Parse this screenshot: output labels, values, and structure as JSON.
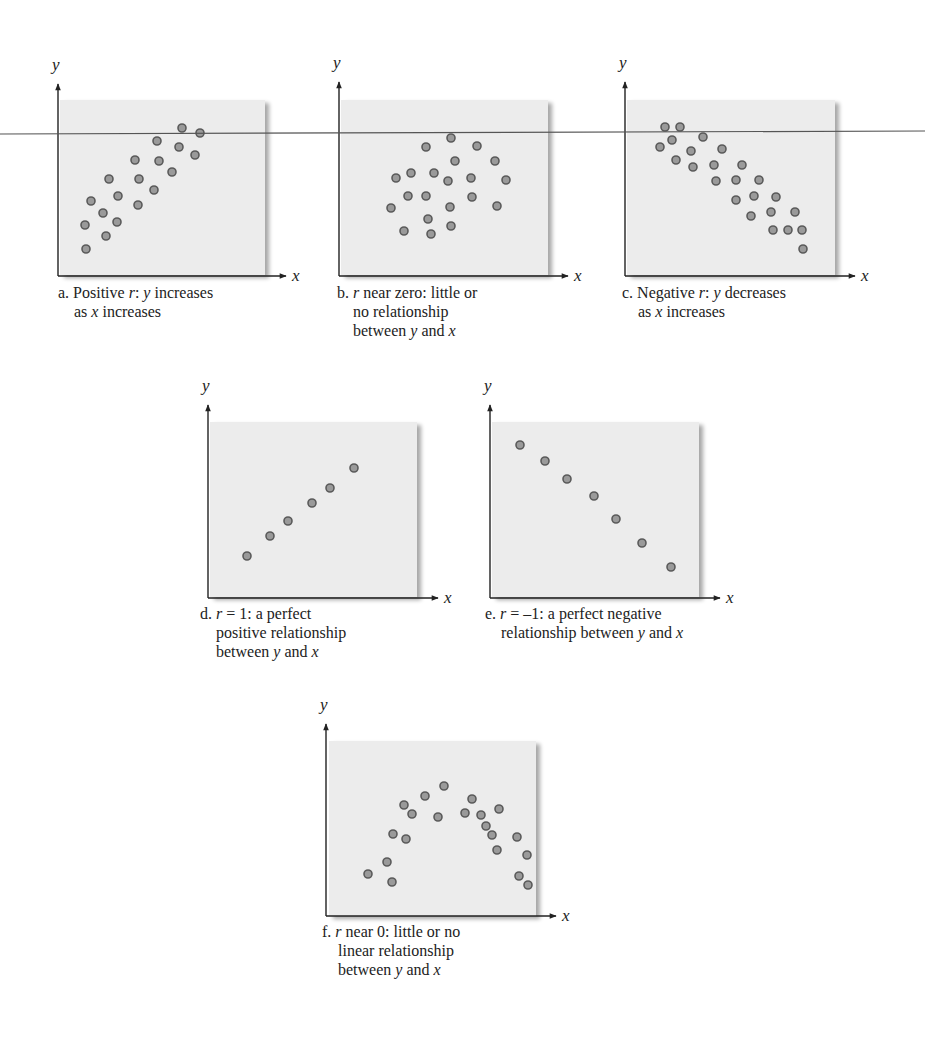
{
  "figure": {
    "stray_line": {
      "x1": 0,
      "y1": 134,
      "x2": 925,
      "y2": 131,
      "color": "#555555"
    },
    "colors": {
      "panel_fill": "#ececec",
      "panel_shadow": "#c8c8c8",
      "dot_fill": "#9a9a9a",
      "dot_stroke": "#5a5a5a",
      "axis": "#222222"
    }
  },
  "chart_data": [
    {
      "type": "scatter",
      "id": "a",
      "title": "a. Positive r: y increases as x increases",
      "caption_lines": [
        "a. Positive <i>r</i>: <i>y</i> increases",
        "as <i>x</i> increases"
      ],
      "xlabel": "x",
      "ylabel": "y",
      "axis": {
        "ox": 58,
        "oy": 276,
        "ytop": 84,
        "xend": 286
      },
      "rect": {
        "x": 60,
        "y": 100,
        "w": 205,
        "h": 175
      },
      "caption": {
        "x": 58,
        "y": 283
      },
      "points": [
        [
          182,
          128
        ],
        [
          200,
          133
        ],
        [
          157,
          141
        ],
        [
          179,
          147
        ],
        [
          195,
          155
        ],
        [
          135,
          160
        ],
        [
          159,
          161
        ],
        [
          172,
          172
        ],
        [
          109,
          179
        ],
        [
          139,
          179
        ],
        [
          154,
          190
        ],
        [
          91,
          201
        ],
        [
          118,
          196
        ],
        [
          103,
          213
        ],
        [
          138,
          205
        ],
        [
          117,
          222
        ],
        [
          85,
          225
        ],
        [
          106,
          236
        ],
        [
          86,
          249
        ]
      ]
    },
    {
      "type": "scatter",
      "id": "b",
      "title": "b. r near zero: little or no relationship between y and x",
      "caption_lines": [
        "b. <i>r</i> near zero: little or",
        "no relationship",
        "between <i>y</i> and <i>x</i>"
      ],
      "xlabel": "x",
      "ylabel": "y",
      "axis": {
        "ox": 339,
        "oy": 276,
        "ytop": 82,
        "xend": 568
      },
      "rect": {
        "x": 341,
        "y": 100,
        "w": 207,
        "h": 175
      },
      "caption": {
        "x": 337,
        "y": 283
      },
      "points": [
        [
          451,
          138
        ],
        [
          426,
          147
        ],
        [
          477,
          146
        ],
        [
          455,
          161
        ],
        [
          495,
          161
        ],
        [
          396,
          178
        ],
        [
          411,
          173
        ],
        [
          434,
          173
        ],
        [
          448,
          181
        ],
        [
          471,
          178
        ],
        [
          506,
          180
        ],
        [
          408,
          196
        ],
        [
          426,
          196
        ],
        [
          472,
          197
        ],
        [
          391,
          208
        ],
        [
          450,
          207
        ],
        [
          497,
          206
        ],
        [
          428,
          219
        ],
        [
          404,
          231
        ],
        [
          451,
          226
        ],
        [
          431,
          234
        ]
      ]
    },
    {
      "type": "scatter",
      "id": "c",
      "title": "c. Negative r: y decreases as x increases",
      "caption_lines": [
        "c. Negative <i>r</i>: <i>y</i> decreases",
        "as <i>x</i> increases"
      ],
      "xlabel": "x",
      "ylabel": "y",
      "axis": {
        "ox": 625,
        "oy": 276,
        "ytop": 82,
        "xend": 855
      },
      "rect": {
        "x": 627,
        "y": 100,
        "w": 208,
        "h": 175
      },
      "caption": {
        "x": 622,
        "y": 283
      },
      "points": [
        [
          665,
          127
        ],
        [
          680,
          127
        ],
        [
          672,
          140
        ],
        [
          703,
          137
        ],
        [
          660,
          147
        ],
        [
          691,
          151
        ],
        [
          722,
          149
        ],
        [
          676,
          160
        ],
        [
          693,
          167
        ],
        [
          714,
          165
        ],
        [
          742,
          165
        ],
        [
          716,
          181
        ],
        [
          736,
          180
        ],
        [
          759,
          180
        ],
        [
          736,
          200
        ],
        [
          754,
          196
        ],
        [
          776,
          197
        ],
        [
          751,
          216
        ],
        [
          771,
          212
        ],
        [
          795,
          212
        ],
        [
          773,
          230
        ],
        [
          788,
          230
        ],
        [
          802,
          230
        ],
        [
          803,
          249
        ]
      ]
    },
    {
      "type": "scatter",
      "id": "d",
      "title": "d. r = 1: a perfect positive relationship between y and x",
      "caption_lines": [
        "d.  <i>r</i> = 1: a perfect",
        "positive relationship",
        "between <i>y</i> and <i>x</i>"
      ],
      "xlabel": "x",
      "ylabel": "y",
      "axis": {
        "ox": 208,
        "oy": 598,
        "ytop": 405,
        "xend": 438
      },
      "rect": {
        "x": 210,
        "y": 422,
        "w": 207,
        "h": 175
      },
      "caption": {
        "x": 200,
        "y": 604
      },
      "points": [
        [
          247,
          556
        ],
        [
          270,
          536
        ],
        [
          288,
          521
        ],
        [
          312,
          503
        ],
        [
          330,
          488
        ],
        [
          354,
          468
        ]
      ]
    },
    {
      "type": "scatter",
      "id": "e",
      "title": "e. r = −1: a perfect negative relationship between y and x",
      "caption_lines": [
        "e.  <i>r</i> = –1: a perfect negative",
        "relationship between <i>y</i> and <i>x</i>"
      ],
      "xlabel": "x",
      "ylabel": "y",
      "axis": {
        "ox": 490,
        "oy": 598,
        "ytop": 405,
        "xend": 720
      },
      "rect": {
        "x": 492,
        "y": 422,
        "w": 207,
        "h": 175
      },
      "caption": {
        "x": 485,
        "y": 604
      },
      "points": [
        [
          520,
          445
        ],
        [
          545,
          461
        ],
        [
          567,
          479
        ],
        [
          594,
          496
        ],
        [
          616,
          519
        ],
        [
          642,
          543
        ],
        [
          671,
          567
        ]
      ]
    },
    {
      "type": "scatter",
      "id": "f",
      "title": "f. r near 0: little or no linear relationship between y and x",
      "caption_lines": [
        "f.  <i>r</i> near 0: little or no",
        "linear relationship",
        "between <i>y</i> and <i>x</i>"
      ],
      "xlabel": "x",
      "ylabel": "y",
      "axis": {
        "ox": 326,
        "oy": 916,
        "ytop": 724,
        "xend": 556
      },
      "rect": {
        "x": 329,
        "y": 741,
        "w": 207,
        "h": 175
      },
      "caption": {
        "x": 322,
        "y": 922
      },
      "points": [
        [
          444,
          786
        ],
        [
          425,
          796
        ],
        [
          472,
          799
        ],
        [
          404,
          805
        ],
        [
          412,
          814
        ],
        [
          465,
          813
        ],
        [
          438,
          817
        ],
        [
          481,
          815
        ],
        [
          499,
          809
        ],
        [
          393,
          834
        ],
        [
          486,
          826
        ],
        [
          492,
          835
        ],
        [
          406,
          839
        ],
        [
          517,
          837
        ],
        [
          497,
          850
        ],
        [
          387,
          862
        ],
        [
          527,
          855
        ],
        [
          368,
          874
        ],
        [
          392,
          882
        ],
        [
          519,
          876
        ],
        [
          528,
          885
        ]
      ]
    }
  ]
}
